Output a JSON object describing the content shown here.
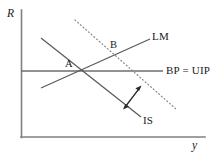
{
  "figure": {
    "background_color": "#ffffff",
    "width": 221,
    "height": 156
  },
  "axes": {
    "y_axis_label": "R",
    "x_axis_label": "y",
    "axis_color": "#808080",
    "origin": {
      "x": 21,
      "y": 137
    },
    "y_axis_top": {
      "x": 21,
      "y": 10
    },
    "x_axis_right": {
      "x": 205,
      "y": 137
    }
  },
  "curves": [
    {
      "id": "lm",
      "label": "LM",
      "style": "solid",
      "color": "#5a5a5a",
      "slope": "upward",
      "start": {
        "x": 41,
        "y": 88
      },
      "end": {
        "x": 150,
        "y": 39
      }
    },
    {
      "id": "is",
      "label": "IS",
      "style": "solid",
      "color": "#5a5a5a",
      "slope": "downward",
      "start": {
        "x": 41,
        "y": 38
      },
      "end": {
        "x": 141,
        "y": 117
      }
    },
    {
      "id": "is-shifted",
      "label": "",
      "style": "dotted",
      "color": "#8a8a8a",
      "slope": "downward",
      "start": {
        "x": 75,
        "y": 20
      },
      "end": {
        "x": 176,
        "y": 109
      }
    },
    {
      "id": "bp-uip",
      "label": "BP = UIP",
      "style": "solid-horizontal",
      "color": "#6e6e6e",
      "start": {
        "x": 21,
        "y": 71
      },
      "end": {
        "x": 163,
        "y": 71
      }
    }
  ],
  "points": [
    {
      "id": "point-a",
      "label": "A",
      "x": 83,
      "y": 71,
      "description": "initial equilibrium on BP = UIP"
    },
    {
      "id": "point-b",
      "label": "B",
      "x": 120,
      "y": 53,
      "description": "new equilibrium after IS shift"
    }
  ],
  "annotations": {
    "shift_arrows": [
      {
        "id": "arrow-outward",
        "direction": "up-right",
        "from": {
          "x": 126,
          "y": 106
        },
        "to": {
          "x": 141,
          "y": 86
        }
      },
      {
        "id": "arrow-inward",
        "direction": "down-left",
        "from": {
          "x": 138,
          "y": 90
        },
        "to": {
          "x": 123,
          "y": 109
        }
      }
    ]
  },
  "labels": {
    "y_axis": "R",
    "x_axis": "y",
    "lm": "LM",
    "is": "IS",
    "bp_uip": "BP = UIP",
    "point_a": "A",
    "point_b": "B"
  }
}
